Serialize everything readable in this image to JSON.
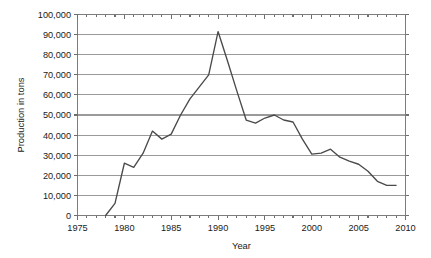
{
  "chart_data": {
    "type": "line",
    "title": "",
    "xlabel": "Year",
    "ylabel": "Production in tons",
    "xlim": [
      1975,
      2010
    ],
    "ylim": [
      0,
      100000
    ],
    "grid": "horizontal",
    "legend": "none",
    "x_ticks": [
      1975,
      1980,
      1985,
      1990,
      1995,
      2000,
      2005,
      2010
    ],
    "x_tick_labels": [
      "1975",
      "1980",
      "1985",
      "1990",
      "1995",
      "2000",
      "2005",
      "2010"
    ],
    "x_minor_tick_step": 1,
    "y_ticks": [
      0,
      10000,
      20000,
      30000,
      40000,
      50000,
      60000,
      70000,
      80000,
      90000,
      100000
    ],
    "y_tick_labels": [
      "0",
      "10,000",
      "20,000",
      "30,000",
      "40,000",
      "50,000",
      "60,000",
      "70,000",
      "80,000",
      "90,000",
      "100,000"
    ],
    "series": [
      {
        "name": "Production",
        "color": "#4a4a4a",
        "x": [
          1978,
          1979,
          1980,
          1981,
          1982,
          1983,
          1984,
          1985,
          1986,
          1987,
          1988,
          1989,
          1990,
          1991,
          1992,
          1993,
          1994,
          1995,
          1996,
          1997,
          1998,
          1999,
          2000,
          2001,
          2002,
          2003,
          2004,
          2005,
          2006,
          2007,
          2008,
          2009
        ],
        "values": [
          0,
          6000,
          26000,
          24000,
          31000,
          42000,
          38000,
          40500,
          50000,
          58000,
          64000,
          70000,
          91500,
          77000,
          62000,
          47500,
          46000,
          48500,
          50000,
          47500,
          46500,
          38000,
          30500,
          31000,
          33000,
          29000,
          27000,
          25500,
          22000,
          17000,
          15000,
          15000
        ]
      }
    ],
    "annotations": {
      "peak_year": 1990,
      "peak_value": 91500,
      "start_year": 1978,
      "end_year": 2009,
      "end_value": 15000
    }
  },
  "colors": {
    "gridline": "#9a9a9a",
    "frame": "#7d7d7d",
    "series": "#4a4a4a",
    "text": "#1a1a1a",
    "background": "#ffffff"
  }
}
